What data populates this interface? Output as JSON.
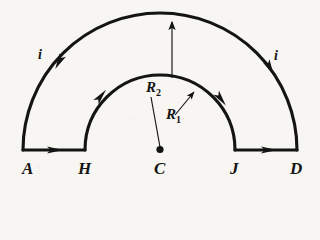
{
  "figure": {
    "background_color": "#f7f6f2",
    "stroke_color": "#141414",
    "geometry": {
      "center": {
        "x": 160,
        "y": 150
      },
      "inner_radius_px": 75,
      "outer_radius_px": 137,
      "baseline_y": 150,
      "outer_left_x": 23,
      "inner_left_x": 85,
      "inner_right_x": 235,
      "outer_right_x": 297
    },
    "point_labels": [
      {
        "id": "A",
        "text": "A",
        "x": 22,
        "y": 162
      },
      {
        "id": "H",
        "text": "H",
        "x": 78,
        "y": 162
      },
      {
        "id": "C",
        "text": "C",
        "x": 154,
        "y": 162
      },
      {
        "id": "J",
        "text": "J",
        "x": 230,
        "y": 162
      },
      {
        "id": "D",
        "text": "D",
        "x": 290,
        "y": 162
      }
    ],
    "current_labels": [
      {
        "id": "i-left",
        "text": "i",
        "x": 38,
        "y": 48
      },
      {
        "id": "i-right",
        "text": "i",
        "x": 274,
        "y": 49
      }
    ],
    "radius_labels": [
      {
        "id": "R2",
        "base": "R",
        "sub": "2",
        "x": 146,
        "y": 80
      },
      {
        "id": "R1",
        "base": "R",
        "sub": "1",
        "x": 166,
        "y": 107
      }
    ],
    "arrows": {
      "outer_left_arc": {
        "direction": "counterclockwise-down-left",
        "at": {
          "x": 59,
          "y": 62
        }
      },
      "outer_right_arc": {
        "direction": "clockwise-down-right",
        "at": {
          "x": 270,
          "y": 68
        }
      },
      "inner_left_arc": {
        "direction": "clockwise-up-right",
        "at": {
          "x": 101,
          "y": 96
        }
      },
      "inner_right_arc": {
        "direction": "clockwise-down-right",
        "at": {
          "x": 221,
          "y": 99
        }
      },
      "bottom_left_segment": {
        "direction": "right",
        "at": {
          "x": 56,
          "y": 150
        }
      },
      "bottom_right_segment": {
        "direction": "right",
        "at": {
          "x": 270,
          "y": 150
        }
      },
      "R2_radius": {
        "from": {
          "x": 172,
          "y": 78
        },
        "to": {
          "x": 172,
          "y": 20
        }
      },
      "R1_radius": {
        "from": {
          "x": 176,
          "y": 114
        },
        "to": {
          "x": 193,
          "y": 93
        }
      },
      "R2_leader": {
        "from": {
          "x": 160,
          "y": 148
        },
        "to": {
          "x": 151,
          "y": 96
        }
      }
    }
  }
}
